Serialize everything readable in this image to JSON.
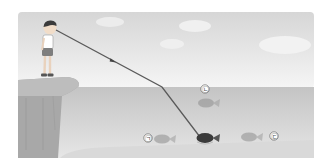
{
  "figure": {
    "labels": {
      "a": "㉠",
      "b": "㉡",
      "c": "㉢"
    },
    "elements": {
      "observer": "boy standing on cliff",
      "light_path": "line of sight from eye to fish, refracted at water surface",
      "real_fish": "dark fish at bottom where line ends",
      "image_fish_a": "faded fish labeled ㉠",
      "image_fish_b": "faded fish labeled ㉡ (raised)",
      "image_fish_c": "faded fish labeled ㉢"
    },
    "colors": {
      "sky_top": "#dcdcdc",
      "sky_bottom": "#f4f4f4",
      "water": "#cfcfcf",
      "cliff": "#a9a9a9",
      "line": "#555555",
      "real_fish": "#3a3a3a",
      "faded_fish": "#9a9a9a"
    }
  }
}
